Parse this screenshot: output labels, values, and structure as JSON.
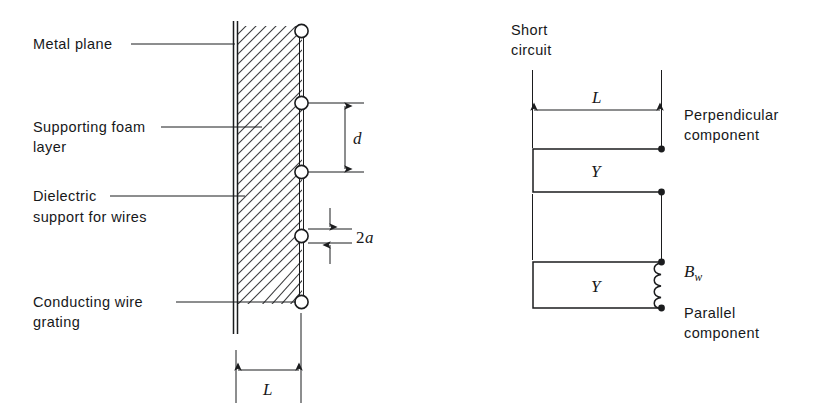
{
  "figure": {
    "title_visible": false,
    "background_color": "#ffffff",
    "line_color": "#1b1c1e"
  },
  "left_diagram": {
    "name": "wire-grating-cross-section",
    "labels": [
      {
        "id": "metal-plane",
        "text": "Metal plane"
      },
      {
        "id": "supporting-foam-1",
        "text": "Supporting foam"
      },
      {
        "id": "supporting-foam-2",
        "text": "layer"
      },
      {
        "id": "dielectric-1",
        "text": "Dielectric"
      },
      {
        "id": "dielectric-2",
        "text": "support for wires"
      },
      {
        "id": "conducting-wire-1",
        "text": "Conducting wire"
      },
      {
        "id": "conducting-wire-2",
        "text": "grating"
      }
    ],
    "dimensions": [
      {
        "id": "wire-spacing",
        "symbol": "d",
        "orientation": "vertical"
      },
      {
        "id": "wire-diameter",
        "symbol": "2a",
        "orientation": "vertical"
      },
      {
        "id": "layer-thickness",
        "symbol": "L",
        "orientation": "horizontal"
      }
    ],
    "wire_count": 5
  },
  "right_diagram": {
    "name": "equivalent-circuit",
    "labels": [
      {
        "id": "short-circuit-1",
        "text": "Short"
      },
      {
        "id": "short-circuit-2",
        "text": "circuit"
      },
      {
        "id": "perpendicular-1",
        "text": "Perpendicular"
      },
      {
        "id": "perpendicular-2",
        "text": "component"
      },
      {
        "id": "parallel-1",
        "text": "Parallel"
      },
      {
        "id": "parallel-2",
        "text": "component"
      }
    ],
    "dimensions": [
      {
        "id": "line-length",
        "symbol": "L",
        "orientation": "horizontal"
      }
    ],
    "elements": [
      {
        "id": "admittance-perpendicular",
        "symbol": "Y",
        "type": "transmission-line-stub"
      },
      {
        "id": "admittance-parallel",
        "symbol": "Y",
        "type": "transmission-line-stub"
      },
      {
        "id": "wire-susceptance",
        "symbol": "B",
        "subscript": "w",
        "type": "inductor"
      }
    ]
  }
}
